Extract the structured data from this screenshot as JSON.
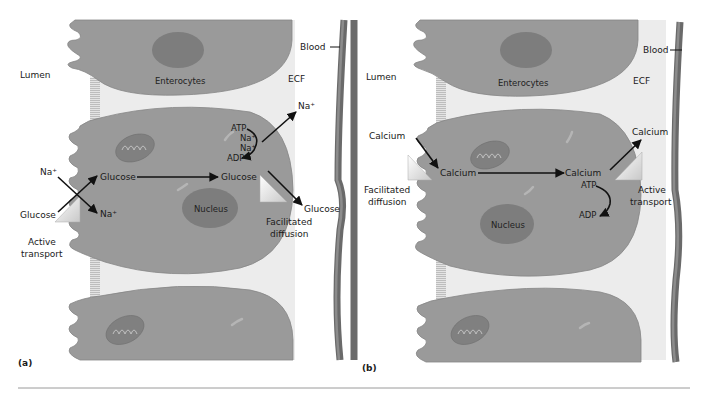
{
  "figure": {
    "panels": [
      {
        "id": "a",
        "panel_label": "(a)",
        "regions": {
          "lumen": "Lumen",
          "ecf": "ECF",
          "blood": "Blood"
        },
        "cell_label": "Enterocytes",
        "nucleus_label": "Nucleus",
        "apical": {
          "transporter_label_line1": "Active",
          "transporter_label_line2": "transport",
          "na_in": "Na⁺",
          "na_out": "Na⁺",
          "glucose_in": "Glucose",
          "glucose_cell": "Glucose"
        },
        "cytoplasm": {
          "glucose_basal": "Glucose"
        },
        "pump": {
          "atp": "ATP",
          "na1": "Na⁺",
          "na2": "Na⁺",
          "adp": "ADP",
          "na_ecf": "Na⁺"
        },
        "basolateral": {
          "transporter_label_line1": "Facilitated",
          "transporter_label_line2": "diffusion",
          "glucose_out": "Glucose"
        }
      },
      {
        "id": "b",
        "panel_label": "(b)",
        "regions": {
          "lumen": "Lumen",
          "ecf": "ECF",
          "blood": "Blood"
        },
        "cell_label": "Enterocytes",
        "nucleus_label": "Nucleus",
        "apical": {
          "transporter_label_line1": "Facilitated",
          "transporter_label_line2": "diffusion",
          "calcium_lumen": "Calcium",
          "calcium_cell": "Calcium"
        },
        "cytoplasm": {
          "calcium_basal": "Calcium",
          "atp": "ATP",
          "adp": "ADP"
        },
        "basolateral": {
          "transporter_label_line1": "Active",
          "transporter_label_line2": "transport",
          "calcium_out": "Calcium"
        }
      }
    ]
  },
  "colors": {
    "cell": "#9a9a9a",
    "nucleus": "#7d7d7d",
    "ecf": "#ececec",
    "vessel": "#6a6a6a",
    "arrow": "#111111"
  }
}
